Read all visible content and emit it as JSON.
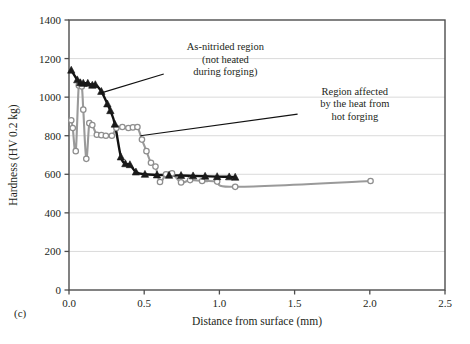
{
  "panel": {
    "label": "(c)"
  },
  "chart_data": {
    "type": "line",
    "title": "",
    "xlabel": "Distance from surface (mm)",
    "ylabel": "Hardness (HV 0.2 kg)",
    "xlim": [
      0.0,
      2.5
    ],
    "ylim": [
      0,
      1400
    ],
    "xticks": [
      "0.0",
      "0.5",
      "1.0",
      "1.5",
      "2.0",
      "2.5"
    ],
    "xtick_values": [
      0.0,
      0.5,
      1.0,
      1.5,
      2.0,
      2.5
    ],
    "yticks": [
      "0",
      "200",
      "400",
      "600",
      "800",
      "1000",
      "1200",
      "1400"
    ],
    "ytick_values": [
      0,
      200,
      400,
      600,
      800,
      1000,
      1200,
      1400
    ],
    "grid": "horizontal",
    "legend_position": "none",
    "series": [
      {
        "name": "As-nitrided region (not heated during forging)",
        "marker": "triangle",
        "color": "#1a1a1a",
        "line_color": "#111111",
        "points": [
          {
            "x": 0.015,
            "y": 1140
          },
          {
            "x": 0.055,
            "y": 1090
          },
          {
            "x": 0.075,
            "y": 1075
          },
          {
            "x": 0.095,
            "y": 1072
          },
          {
            "x": 0.125,
            "y": 1072
          },
          {
            "x": 0.155,
            "y": 1062
          },
          {
            "x": 0.175,
            "y": 1065
          },
          {
            "x": 0.215,
            "y": 1030
          },
          {
            "x": 0.255,
            "y": 965
          },
          {
            "x": 0.275,
            "y": 930
          },
          {
            "x": 0.305,
            "y": 860
          },
          {
            "x": 0.345,
            "y": 690
          },
          {
            "x": 0.375,
            "y": 655
          },
          {
            "x": 0.405,
            "y": 650
          },
          {
            "x": 0.445,
            "y": 612
          },
          {
            "x": 0.505,
            "y": 600
          },
          {
            "x": 0.585,
            "y": 597
          },
          {
            "x": 0.665,
            "y": 595
          },
          {
            "x": 0.745,
            "y": 594
          },
          {
            "x": 0.825,
            "y": 592
          },
          {
            "x": 0.905,
            "y": 590
          },
          {
            "x": 0.985,
            "y": 588
          },
          {
            "x": 1.065,
            "y": 587
          },
          {
            "x": 1.105,
            "y": 585
          }
        ]
      },
      {
        "name": "Region affected by the heat from hot forging",
        "marker": "circle-open",
        "color": "#8e8e8e",
        "line_color": "#9a9a9a",
        "points": [
          {
            "x": 0.015,
            "y": 880
          },
          {
            "x": 0.025,
            "y": 840
          },
          {
            "x": 0.045,
            "y": 720
          },
          {
            "x": 0.065,
            "y": 1060
          },
          {
            "x": 0.085,
            "y": 1055
          },
          {
            "x": 0.095,
            "y": 935
          },
          {
            "x": 0.115,
            "y": 680
          },
          {
            "x": 0.135,
            "y": 865
          },
          {
            "x": 0.155,
            "y": 855
          },
          {
            "x": 0.185,
            "y": 805
          },
          {
            "x": 0.215,
            "y": 803
          },
          {
            "x": 0.245,
            "y": 800
          },
          {
            "x": 0.285,
            "y": 800
          },
          {
            "x": 0.315,
            "y": 840
          },
          {
            "x": 0.355,
            "y": 845
          },
          {
            "x": 0.395,
            "y": 840
          },
          {
            "x": 0.425,
            "y": 843
          },
          {
            "x": 0.455,
            "y": 845
          },
          {
            "x": 0.485,
            "y": 780
          },
          {
            "x": 0.515,
            "y": 720
          },
          {
            "x": 0.545,
            "y": 660
          },
          {
            "x": 0.575,
            "y": 640
          },
          {
            "x": 0.605,
            "y": 560
          },
          {
            "x": 0.645,
            "y": 600
          },
          {
            "x": 0.685,
            "y": 605
          },
          {
            "x": 0.745,
            "y": 558
          },
          {
            "x": 0.805,
            "y": 570
          },
          {
            "x": 0.885,
            "y": 565
          },
          {
            "x": 0.985,
            "y": 562
          },
          {
            "x": 1.105,
            "y": 535
          },
          {
            "x": 2.005,
            "y": 565
          }
        ]
      }
    ],
    "annotations": [
      {
        "id": "as-nitrided",
        "lines": [
          "As-nitrided region",
          "(not heated",
          "during forging)"
        ],
        "text_x": 1.04,
        "text_y": 1243,
        "pointer_from_x": 0.63,
        "pointer_from_y": 1120,
        "pointer_to_x": 0.215,
        "pointer_to_y": 1022
      },
      {
        "id": "heat-affected",
        "lines": [
          "Region affected",
          "by the heat from",
          "hot forging"
        ],
        "text_x": 1.9,
        "text_y": 1012,
        "pointer_from_x": 1.52,
        "pointer_from_y": 912,
        "pointer_to_x": 0.475,
        "pointer_to_y": 800
      }
    ]
  }
}
